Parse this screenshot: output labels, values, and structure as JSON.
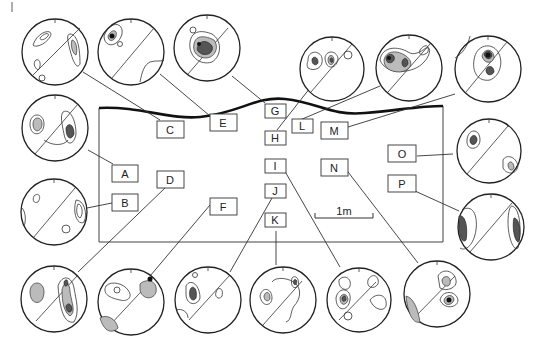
{
  "figure": {
    "type": "stereonet fabric diagram",
    "panel_letter_marker": "|",
    "scale_bar": {
      "label": "1m"
    },
    "outline": {
      "description": "cross-section rectangle with wavy thick upper surface"
    }
  },
  "labels": {
    "A": "A",
    "B": "B",
    "C": "C",
    "D": "D",
    "E": "E",
    "F": "F",
    "G": "G",
    "H": "H",
    "I": "I",
    "J": "J",
    "K": "K",
    "L": "L",
    "M": "M",
    "N": "N",
    "O": "O",
    "P": "P"
  },
  "stereonets": [
    {
      "id": "C",
      "cx": 43,
      "cy": 53
    },
    {
      "id": "E",
      "cx": 131,
      "cy": 52
    },
    {
      "id": "G",
      "cx": 207,
      "cy": 48
    },
    {
      "id": "H",
      "cx": 322,
      "cy": 68
    },
    {
      "id": "L",
      "cx": 397,
      "cy": 67
    },
    {
      "id": "M",
      "cx": 476,
      "cy": 69
    },
    {
      "id": "A",
      "cx": 54,
      "cy": 126
    },
    {
      "id": "O",
      "cx": 489,
      "cy": 151
    },
    {
      "id": "B",
      "cx": 54,
      "cy": 212
    },
    {
      "id": "P",
      "cx": 491,
      "cy": 225
    },
    {
      "id": "D",
      "cx": 54,
      "cy": 299
    },
    {
      "id": "F",
      "cx": 131,
      "cy": 301
    },
    {
      "id": "J",
      "cx": 208,
      "cy": 299
    },
    {
      "id": "K",
      "cx": 283,
      "cy": 300
    },
    {
      "id": "I",
      "cx": 360,
      "cy": 299
    },
    {
      "id": "N",
      "cx": 437,
      "cy": 293
    }
  ]
}
